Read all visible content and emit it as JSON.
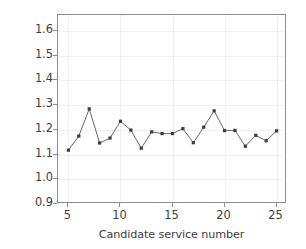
{
  "chart_data": {
    "type": "line",
    "title": "",
    "xlabel": "Candidate service number",
    "ylabel": "Execution time(ms)",
    "xlim": [
      4.0,
      26.0
    ],
    "ylim": [
      0.9,
      1.665
    ],
    "xticks": [
      5,
      10,
      15,
      20,
      25
    ],
    "xtick_labels": [
      "5",
      "10",
      "15",
      "20",
      "25"
    ],
    "yticks": [
      0.9,
      1.0,
      1.1,
      1.2,
      1.3,
      1.4,
      1.5,
      1.6
    ],
    "ytick_labels": [
      "0.9",
      "1.0",
      "1.1",
      "1.2",
      "1.3",
      "1.4",
      "1.5",
      "1.6"
    ],
    "grid": true,
    "legend": null,
    "marker": "square",
    "marker_color": "#3a3a4a",
    "line_color": "#555566",
    "x": [
      5,
      6,
      7,
      8,
      9,
      10,
      11,
      12,
      13,
      14,
      15,
      16,
      17,
      18,
      19,
      20,
      21,
      22,
      23,
      24,
      25
    ],
    "values": [
      1.118,
      1.175,
      1.285,
      1.147,
      1.167,
      1.235,
      1.199,
      1.126,
      1.192,
      1.185,
      1.185,
      1.205,
      1.148,
      1.211,
      1.277,
      1.197,
      1.198,
      1.134,
      1.178,
      1.156,
      1.196
    ],
    "series": [
      {
        "name": "Execution time",
        "values": [
          1.118,
          1.175,
          1.285,
          1.147,
          1.167,
          1.235,
          1.199,
          1.126,
          1.192,
          1.185,
          1.185,
          1.205,
          1.148,
          1.211,
          1.277,
          1.197,
          1.198,
          1.134,
          1.178,
          1.156,
          1.196
        ]
      }
    ]
  },
  "colors": {
    "axis": "#8d8d8d",
    "grid": "#f0f0f2",
    "text": "#3d3d3d",
    "marker": "#3a3a4a",
    "line": "#555566",
    "background": "#ffffff"
  }
}
